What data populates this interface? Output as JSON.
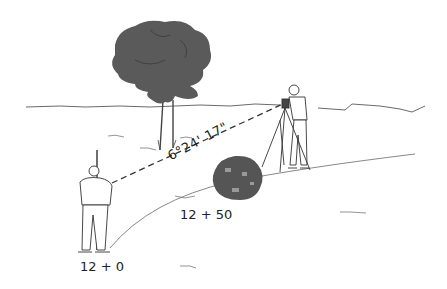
{
  "illustration": {
    "subject": "surveying traverse with transit instrument",
    "labels": {
      "angle": "6°24' 17\"",
      "station_mid": "12 + 50",
      "station_start": "12 + 0"
    },
    "elements": [
      "tree",
      "horizon-line",
      "instrument-operator",
      "tripod-transit",
      "rod-person",
      "bush-obstacle",
      "sight-line",
      "ground-curve"
    ],
    "colors": {
      "foliage": "#5a5a5a",
      "line": "#333333",
      "background": "#ffffff"
    }
  }
}
